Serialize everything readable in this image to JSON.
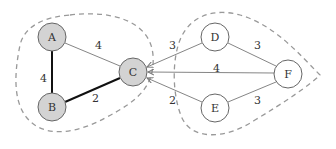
{
  "diagram": {
    "type": "weighted-graph-cut",
    "nodes": [
      {
        "id": "A",
        "label": "A",
        "x": 52,
        "y": 37,
        "fill": "#d3d3d3",
        "group": "left"
      },
      {
        "id": "B",
        "label": "B",
        "x": 52,
        "y": 107,
        "fill": "#d3d3d3",
        "group": "left"
      },
      {
        "id": "C",
        "label": "C",
        "x": 133,
        "y": 72,
        "fill": "#d3d3d3",
        "group": "left"
      },
      {
        "id": "D",
        "label": "D",
        "x": 215,
        "y": 37,
        "fill": "#ffffff",
        "group": "right"
      },
      {
        "id": "E",
        "label": "E",
        "x": 215,
        "y": 108,
        "fill": "#ffffff",
        "group": "right"
      },
      {
        "id": "F",
        "label": "F",
        "x": 288,
        "y": 74,
        "fill": "#ffffff",
        "group": "right"
      }
    ],
    "edges": [
      {
        "from": "A",
        "to": "B",
        "weight": "4",
        "bold": true,
        "label_x": 42,
        "label_y": 80
      },
      {
        "from": "B",
        "to": "C",
        "weight": "2",
        "bold": true,
        "label_x": 94,
        "label_y": 101
      },
      {
        "from": "A",
        "to": "C",
        "weight": "4",
        "bold": false,
        "label_x": 97,
        "label_y": 49
      },
      {
        "from": "D",
        "to": "C",
        "weight": "3",
        "bold": false,
        "arrow_to_C": true,
        "label_x": 172,
        "label_y": 48
      },
      {
        "from": "F",
        "to": "C",
        "weight": "4",
        "bold": false,
        "arrow_to_C": true,
        "label_x": 216,
        "label_y": 72
      },
      {
        "from": "E",
        "to": "C",
        "weight": "2",
        "bold": false,
        "arrow_to_C": true,
        "label_x": 172,
        "label_y": 105
      },
      {
        "from": "D",
        "to": "F",
        "weight": "3",
        "bold": false,
        "label_x": 258,
        "label_y": 49
      },
      {
        "from": "E",
        "to": "F",
        "weight": "3",
        "bold": false,
        "label_x": 257,
        "label_y": 105
      }
    ],
    "regions": [
      {
        "name": "left-cluster",
        "members": [
          "A",
          "B",
          "C"
        ],
        "style": "dashed",
        "color": "#999999"
      },
      {
        "name": "right-cluster",
        "members": [
          "D",
          "E",
          "F"
        ],
        "style": "dashed",
        "color": "#999999"
      }
    ],
    "colors": {
      "edge": "#777777",
      "bold_edge": "#111111",
      "node_stroke": "#666666",
      "shaded_node": "#d3d3d3",
      "dash": "#999999"
    }
  }
}
